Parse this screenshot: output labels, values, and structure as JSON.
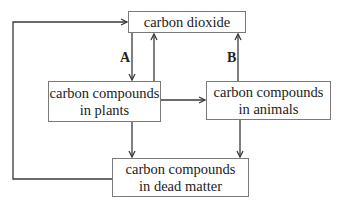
{
  "diagram": {
    "nodes": {
      "co2": {
        "label": "carbon dioxide"
      },
      "plants": {
        "line1": "carbon compounds",
        "line2": "in plants"
      },
      "animals": {
        "line1": "carbon compounds",
        "line2": "in animals"
      },
      "dead": {
        "line1": "carbon compounds",
        "line2": "in dead matter"
      }
    },
    "edge_labels": {
      "a": "A",
      "b": "B"
    },
    "edges": [
      {
        "from": "carbon dioxide",
        "to": "carbon compounds in plants",
        "label": "A"
      },
      {
        "from": "carbon compounds in plants",
        "to": "carbon dioxide",
        "label": ""
      },
      {
        "from": "carbon compounds in animals",
        "to": "carbon dioxide",
        "label": "B"
      },
      {
        "from": "carbon compounds in plants",
        "to": "carbon compounds in animals",
        "label": ""
      },
      {
        "from": "carbon compounds in plants",
        "to": "carbon compounds in dead matter",
        "label": ""
      },
      {
        "from": "carbon compounds in animals",
        "to": "carbon compounds in dead matter",
        "label": ""
      },
      {
        "from": "carbon compounds in dead matter",
        "to": "carbon dioxide",
        "label": ""
      }
    ],
    "colors": {
      "line": "#3a3a3a",
      "box_border": "#7a7a7a",
      "text": "#222222"
    }
  }
}
